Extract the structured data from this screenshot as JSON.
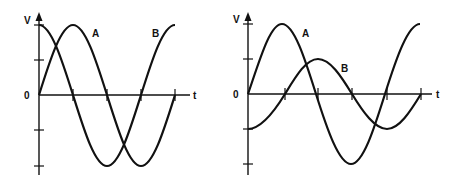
{
  "diagrams": [
    {
      "id": "left",
      "y_axis_label": "V",
      "x_axis_label": "t",
      "origin_label": "0",
      "origin": [
        39,
        95
      ],
      "amplitude_px": 70,
      "period_px": 136,
      "x_end": 190,
      "y_top": 15,
      "y_bottom": 175,
      "y_ticks": [
        25,
        60,
        130,
        166
      ],
      "x_ticks": [
        73,
        107,
        141,
        175
      ],
      "waves": [
        {
          "name": "A",
          "amplitude": 1.0,
          "phase": "sine",
          "label_pos": [
            92,
            36
          ]
        },
        {
          "name": "B",
          "amplitude": 1.0,
          "phase": "cosine",
          "label_pos": [
            152,
            36
          ]
        }
      ],
      "description": "Two equal-amplitude sine waves, B leads A by 90 degrees"
    },
    {
      "id": "right",
      "y_axis_label": "V",
      "x_axis_label": "t",
      "origin_label": "0",
      "origin": [
        248,
        94
      ],
      "amplitude_px": 70,
      "period_px": 138,
      "x_end": 432,
      "y_top": 15,
      "y_bottom": 175,
      "y_ticks": [
        24,
        59,
        129,
        164
      ],
      "x_ticks": [
        285,
        318,
        352,
        387,
        421
      ],
      "waves": [
        {
          "name": "A",
          "amplitude": 1.0,
          "phase": "sine",
          "label_pos": [
            304,
            37
          ]
        },
        {
          "name": "B",
          "amplitude": 0.5,
          "phase": "negative-cosine",
          "label_pos": [
            343,
            71
          ]
        }
      ],
      "description": "Wave A full amplitude; wave B half amplitude, lagging A by 90 degrees"
    }
  ]
}
